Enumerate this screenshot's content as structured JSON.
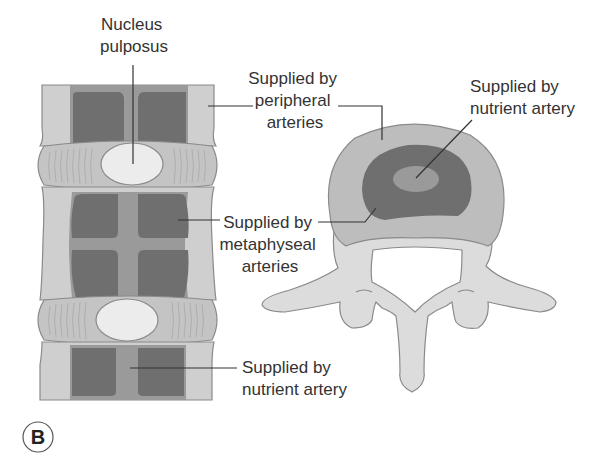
{
  "figure": {
    "panel_label": "B",
    "colors": {
      "outline": "#8a8a8a",
      "bone_light": "#cfcfcf",
      "cortex_mid": "#bdbdbd",
      "dark_region": "#6f6f6f",
      "mid_region": "#9a9a9a",
      "disc": "#c4c4c4",
      "nucleus": "#ececec",
      "posterior_elements": "#dcdcdc",
      "leader_line": "#333333",
      "text": "#333333"
    },
    "labels": {
      "nucleus_pulposus": [
        "Nucleus",
        "pulposus"
      ],
      "peripheral_arteries": [
        "Supplied by",
        "peripheral",
        "arteries"
      ],
      "nutrient_artery_top": [
        "Supplied by",
        "nutrient artery"
      ],
      "metaphyseal_arteries": [
        "Supplied by",
        "metaphyseal",
        "arteries"
      ],
      "nutrient_artery_bottom": [
        "Supplied by",
        "nutrient artery"
      ]
    }
  }
}
